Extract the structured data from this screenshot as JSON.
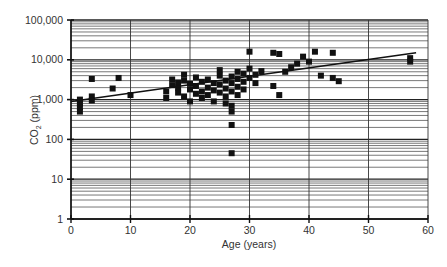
{
  "chart_data": {
    "type": "scatter",
    "title": "",
    "xlabel": "Age (years)",
    "ylabel": "CO2 (ppm)",
    "ylabel_main": "CO",
    "ylabel_sub": "2",
    "ylabel_rest": " (ppm)",
    "xlim": [
      0,
      60
    ],
    "ylim": [
      1,
      100000
    ],
    "yscale": "log",
    "grid": true,
    "x_ticks": [
      "0",
      "10",
      "20",
      "30",
      "40",
      "50",
      "60"
    ],
    "y_ticks": [
      "1",
      "10",
      "100",
      "1,000",
      "10,000",
      "100,000"
    ],
    "legend": [],
    "trendline": {
      "x": [
        0,
        58
      ],
      "y": [
        900,
        15000
      ]
    },
    "series": [
      {
        "name": "Measurements",
        "points": [
          [
            1.5,
            1000
          ],
          [
            1.5,
            800
          ],
          [
            1.5,
            650
          ],
          [
            1.5,
            500
          ],
          [
            3.5,
            1200
          ],
          [
            3.5,
            950
          ],
          [
            3.5,
            3300
          ],
          [
            7,
            1900
          ],
          [
            8,
            3500
          ],
          [
            10,
            1300
          ],
          [
            16,
            1100
          ],
          [
            16,
            1600
          ],
          [
            17,
            2300
          ],
          [
            17,
            3200
          ],
          [
            18,
            2700
          ],
          [
            18,
            2000
          ],
          [
            18,
            1500
          ],
          [
            19,
            4200
          ],
          [
            19,
            3000
          ],
          [
            19,
            1200
          ],
          [
            20,
            2500
          ],
          [
            20,
            1800
          ],
          [
            20,
            900
          ],
          [
            21,
            3600
          ],
          [
            21,
            2200
          ],
          [
            21,
            1400
          ],
          [
            22,
            2800
          ],
          [
            22,
            1600
          ],
          [
            22,
            1100
          ],
          [
            23,
            3200
          ],
          [
            23,
            2000
          ],
          [
            23,
            1300
          ],
          [
            24,
            2600
          ],
          [
            24,
            1700
          ],
          [
            24,
            900
          ],
          [
            25,
            4000
          ],
          [
            25,
            2400
          ],
          [
            25,
            1500
          ],
          [
            25,
            5500
          ],
          [
            26,
            3000
          ],
          [
            26,
            1900
          ],
          [
            26,
            1200
          ],
          [
            26,
            800
          ],
          [
            27,
            3800
          ],
          [
            27,
            2600
          ],
          [
            27,
            1600
          ],
          [
            27,
            700
          ],
          [
            27,
            500
          ],
          [
            27,
            230
          ],
          [
            27,
            45
          ],
          [
            28,
            5000
          ],
          [
            28,
            3300
          ],
          [
            28,
            2100
          ],
          [
            28,
            1300
          ],
          [
            29,
            4500
          ],
          [
            29,
            2800
          ],
          [
            29,
            1800
          ],
          [
            30,
            16000
          ],
          [
            30,
            6000
          ],
          [
            30,
            3500
          ],
          [
            31,
            2600
          ],
          [
            31,
            4200
          ],
          [
            32,
            5200
          ],
          [
            34,
            15000
          ],
          [
            34,
            2200
          ],
          [
            35,
            14000
          ],
          [
            35,
            1300
          ],
          [
            36,
            5000
          ],
          [
            37,
            6500
          ],
          [
            38,
            8000
          ],
          [
            39,
            12000
          ],
          [
            40,
            9000
          ],
          [
            41,
            16000
          ],
          [
            42,
            4000
          ],
          [
            44,
            15000
          ],
          [
            44,
            3500
          ],
          [
            45,
            2900
          ],
          [
            57,
            9000
          ],
          [
            57,
            11000
          ]
        ]
      }
    ]
  }
}
